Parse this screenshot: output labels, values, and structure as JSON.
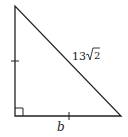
{
  "diagram": {
    "type": "right isosceles triangle",
    "hypotenuse_label": {
      "coef": "13",
      "radical": "2"
    },
    "bottom_leg_label": "b",
    "legs_marked_congruent": true,
    "right_angle_corner": "bottom-left",
    "stroke_color": "#222222"
  }
}
